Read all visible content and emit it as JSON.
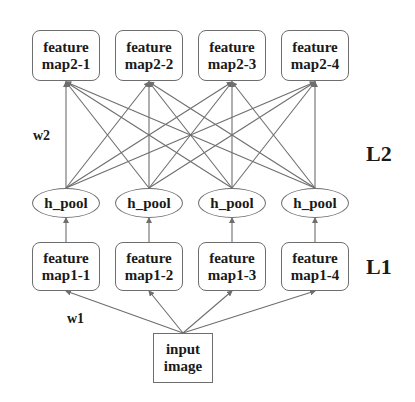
{
  "diagram": {
    "layer2_maps": [
      {
        "line1": "feature",
        "line2": "map2-1"
      },
      {
        "line1": "feature",
        "line2": "map2-2"
      },
      {
        "line1": "feature",
        "line2": "map2-3"
      },
      {
        "line1": "feature",
        "line2": "map2-4"
      }
    ],
    "pool_nodes": [
      {
        "label": "h_pool"
      },
      {
        "label": "h_pool"
      },
      {
        "label": "h_pool"
      },
      {
        "label": "h_pool"
      }
    ],
    "layer1_maps": [
      {
        "line1": "feature",
        "line2": "map1-1"
      },
      {
        "line1": "feature",
        "line2": "map1-2"
      },
      {
        "line1": "feature",
        "line2": "map1-3"
      },
      {
        "line1": "feature",
        "line2": "map1-4"
      }
    ],
    "input": {
      "line1": "input",
      "line2": "image"
    },
    "weight_labels": {
      "w2": "w2",
      "w1": "w1"
    },
    "layer_labels": {
      "l2": "L2",
      "l1": "L1"
    },
    "edges": {
      "pool_to_layer2": "fully connected (each h_pool to every feature map2)",
      "layer1_to_pool": "one-to-one",
      "input_to_layer1": "input image to every feature map1"
    },
    "colors": {
      "stroke": "#6e6e6e",
      "text": "#1a1a1a",
      "background": "#ffffff"
    }
  }
}
